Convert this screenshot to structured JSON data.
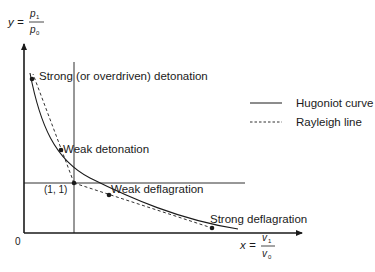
{
  "diagram": {
    "y_axis_label": {
      "lhs": "y =",
      "num": "p",
      "num_sub": "1",
      "den": "p",
      "den_sub": "0"
    },
    "x_axis_label": {
      "lhs": "x =",
      "num": "v",
      "num_sub": "1",
      "den": "v",
      "den_sub": "0"
    },
    "origin_label": "0",
    "reference_point_label": "(1, 1)",
    "points": [
      {
        "label": "Strong (or overdriven) detonation"
      },
      {
        "label": "Weak detonation"
      },
      {
        "label": "Weak deflagration"
      },
      {
        "label": "Strong deflagration"
      }
    ],
    "legend": [
      {
        "label": "Hugoniot curve",
        "style": "solid"
      },
      {
        "label": "Rayleigh line",
        "style": "dashed"
      }
    ],
    "colors": {
      "line": "#1a1a1a",
      "background": "#ffffff"
    }
  }
}
